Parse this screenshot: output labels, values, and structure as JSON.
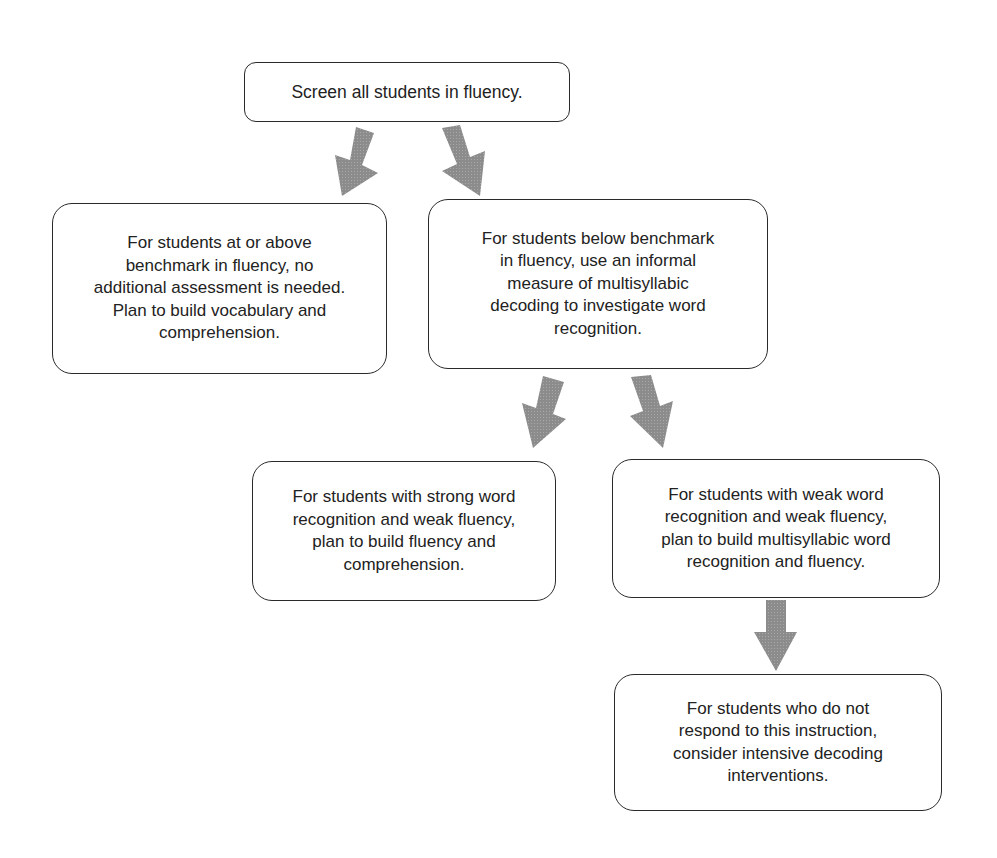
{
  "diagram": {
    "type": "flowchart",
    "arrow_color": "#8a8a8a",
    "nodes": {
      "screen": {
        "text": "Screen all students in fluency."
      },
      "at_or_above": {
        "lines": [
          "For students at or above",
          "benchmark in fluency, no",
          "additional assessment is needed.",
          "Plan to build vocabulary and",
          "comprehension."
        ]
      },
      "below": {
        "lines": [
          "For students below benchmark",
          "in fluency, use an informal",
          "measure of multisyllabic",
          "decoding to investigate word",
          "recognition."
        ]
      },
      "strong_word": {
        "lines": [
          "For students with strong word",
          "recognition and weak fluency,",
          "plan to build fluency and",
          "comprehension."
        ]
      },
      "weak_word": {
        "lines": [
          "For students with weak word",
          "recognition and weak fluency,",
          "plan to build multisyllabic word",
          "recognition and fluency."
        ]
      },
      "no_response": {
        "lines": [
          "For students who do not",
          "respond to this instruction,",
          "consider intensive decoding",
          "interventions."
        ]
      }
    },
    "edges": [
      {
        "from": "screen",
        "to": "at_or_above"
      },
      {
        "from": "screen",
        "to": "below"
      },
      {
        "from": "below",
        "to": "strong_word"
      },
      {
        "from": "below",
        "to": "weak_word"
      },
      {
        "from": "weak_word",
        "to": "no_response"
      }
    ]
  }
}
